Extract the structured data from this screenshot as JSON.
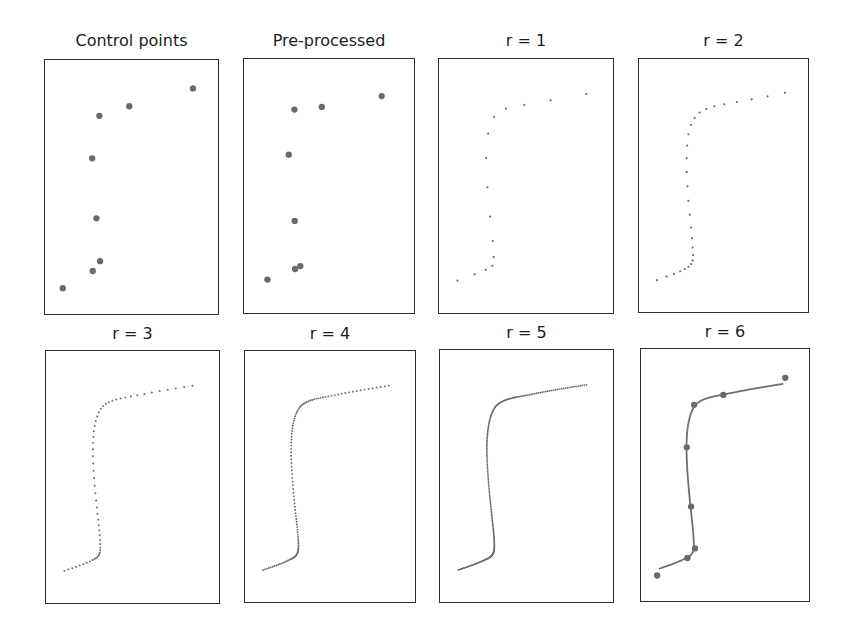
{
  "figure": {
    "background": "#ffffff",
    "frame_color": "#2e2e2e",
    "marker_color": "#6a6a6a",
    "line_color": "#6e6e6e"
  },
  "chart_data": {
    "type": "scatter",
    "grid": false,
    "axes_visible": false,
    "panels": [
      {
        "id": "p1",
        "title": "Control points",
        "kind": "points",
        "frame": {
          "left": 44,
          "top": 59,
          "width": 175,
          "height": 256
        },
        "marker_radius": 3.2,
        "points": [
          [
            149.7,
            28.3
          ],
          [
            85.3,
            46.3
          ],
          [
            55,
            56
          ],
          [
            47.7,
            99
          ],
          [
            52,
            159.7
          ],
          [
            55.7,
            203
          ],
          [
            48.3,
            213
          ],
          [
            18,
            230.3
          ]
        ]
      },
      {
        "id": "p2",
        "title": "Pre-processed",
        "kind": "points",
        "frame": {
          "left": 243,
          "top": 58,
          "width": 172,
          "height": 256
        },
        "marker_radius": 3.2,
        "points": [
          [
            139.3,
            37
          ],
          [
            78.7,
            48
          ],
          [
            51,
            50.7
          ],
          [
            45.3,
            96.3
          ],
          [
            51.3,
            163.3
          ],
          [
            57,
            209
          ],
          [
            51.7,
            212
          ],
          [
            23.7,
            222.7
          ]
        ]
      },
      {
        "id": "p3",
        "title": "r = 1",
        "kind": "subdivision",
        "level": 1,
        "frame": {
          "left": 438,
          "top": 58,
          "width": 176,
          "height": 256
        },
        "marker_radius": 1.1,
        "point_count": 15,
        "points": [
          [
            149,
            35
          ],
          [
            113,
            41.3
          ],
          [
            86.3,
            46
          ],
          [
            67.7,
            49.7
          ],
          [
            55.7,
            58.3
          ],
          [
            49.7,
            75
          ],
          [
            47.7,
            99.7
          ],
          [
            49,
            129.3
          ],
          [
            51.7,
            159
          ],
          [
            54.3,
            183.7
          ],
          [
            55.3,
            200
          ],
          [
            54,
            208.7
          ],
          [
            47.3,
            212.7
          ],
          [
            36,
            217.3
          ],
          [
            18.7,
            223.7
          ]
        ]
      },
      {
        "id": "p4",
        "title": "r = 2",
        "kind": "subdivision",
        "level": 2,
        "frame": {
          "left": 638,
          "top": 58,
          "width": 171,
          "height": 255
        },
        "marker_radius": 1.1,
        "point_count": 29,
        "points": [
          [
            147.7,
            33.7
          ],
          [
            130,
            37.3
          ],
          [
            114,
            40.3
          ],
          [
            99,
            43
          ],
          [
            86.3,
            45.3
          ],
          [
            76.3,
            47.3
          ],
          [
            68,
            50
          ],
          [
            61.3,
            53.7
          ],
          [
            56.3,
            59
          ],
          [
            52.7,
            66.3
          ],
          [
            50,
            75.7
          ],
          [
            48.7,
            87
          ],
          [
            48.3,
            100
          ],
          [
            48.3,
            114
          ],
          [
            49,
            128.3
          ],
          [
            50,
            143
          ],
          [
            51.3,
            157
          ],
          [
            52.7,
            170
          ],
          [
            53.7,
            181
          ],
          [
            54.3,
            190.3
          ],
          [
            54.7,
            198
          ],
          [
            54.3,
            203.3
          ],
          [
            52.7,
            207
          ],
          [
            50,
            209.7
          ],
          [
            46.3,
            212
          ],
          [
            41.7,
            214.3
          ],
          [
            35.3,
            217
          ],
          [
            28,
            219.7
          ],
          [
            18.3,
            223.3
          ]
        ]
      },
      {
        "id": "p5",
        "title": "r = 3",
        "kind": "subdivision",
        "level": 3,
        "frame": {
          "left": 45,
          "top": 350,
          "width": 175,
          "height": 254
        },
        "marker_radius": 1.0,
        "point_count": 57
      },
      {
        "id": "p6",
        "title": "r = 4",
        "kind": "subdivision",
        "level": 4,
        "frame": {
          "left": 244,
          "top": 350,
          "width": 172,
          "height": 253
        },
        "marker_radius": 0.95,
        "point_count": 113
      },
      {
        "id": "p7",
        "title": "r = 5",
        "kind": "subdivision",
        "level": 5,
        "frame": {
          "left": 439,
          "top": 349,
          "width": 175,
          "height": 254
        },
        "marker_radius": 0.9,
        "point_count": 225
      },
      {
        "id": "p8",
        "title": "r = 6",
        "kind": "curve_with_points",
        "level": 6,
        "frame": {
          "left": 640,
          "top": 348,
          "width": 170,
          "height": 254
        },
        "marker_radius": 3.2,
        "point_count": 449,
        "overlay_points": [
          [
            146,
            28.7
          ],
          [
            83.3,
            46
          ],
          [
            53.7,
            56
          ],
          [
            46.3,
            99
          ],
          [
            50.7,
            159
          ],
          [
            54.7,
            201.3
          ],
          [
            47,
            211
          ],
          [
            16.3,
            228.7
          ]
        ]
      }
    ],
    "base_frame": {
      "width": 176,
      "height": 256
    },
    "base_points": [
      [
        149,
        35
      ],
      [
        86.3,
        46
      ],
      [
        55.7,
        58.3
      ],
      [
        47.7,
        99.7
      ],
      [
        51.7,
        159
      ],
      [
        55.3,
        200
      ],
      [
        47.3,
        212.7
      ],
      [
        18.7,
        223.7
      ]
    ],
    "subdivision_weight": 0.0625
  }
}
